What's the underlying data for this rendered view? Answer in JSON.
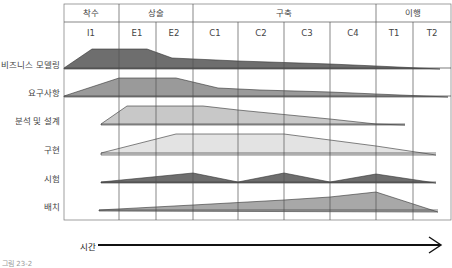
{
  "diagram": {
    "type": "iterative-process-workflow",
    "phases": [
      {
        "label": "착수",
        "iterations": [
          "I1"
        ]
      },
      {
        "label": "상술",
        "iterations": [
          "E1",
          "E2"
        ]
      },
      {
        "label": "구축",
        "iterations": [
          "C1",
          "C2",
          "C3",
          "C4"
        ]
      },
      {
        "label": "이행",
        "iterations": [
          "T1",
          "T2"
        ]
      }
    ],
    "iterations": [
      "I1",
      "E1",
      "E2",
      "C1",
      "C2",
      "C3",
      "C4",
      "T1",
      "T2"
    ],
    "disciplines": [
      {
        "label": "비즈니스 모델링",
        "color": "#6e6e6e"
      },
      {
        "label": "요구사항",
        "color": "#9a9a9a"
      },
      {
        "label": "분석 및 설계",
        "color": "#c8c8c8"
      },
      {
        "label": "구현",
        "color": "#e3e3e3"
      },
      {
        "label": "시험",
        "color": "#6e6e6e"
      },
      {
        "label": "배치",
        "color": "#a8a8a8"
      }
    ],
    "time_axis_label": "시간",
    "caption": "그림 23-2"
  },
  "colors": {
    "grid": "#555555",
    "dark_fill": "#6e6e6e",
    "mid_fill": "#9a9a9a",
    "light_fill": "#c8c8c8",
    "lighter_fill": "#e3e3e3",
    "arrow": "#111111"
  }
}
